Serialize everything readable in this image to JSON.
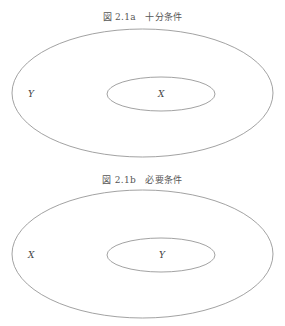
{
  "figures": [
    {
      "caption": "図 2.1a　十分条件",
      "outer_label": "Y",
      "inner_label": "X"
    },
    {
      "caption": "図 2.1b　必要条件",
      "outer_label": "X",
      "inner_label": "Y"
    }
  ],
  "colors": {
    "stroke": "#8a8a8a",
    "text": "#444444"
  }
}
